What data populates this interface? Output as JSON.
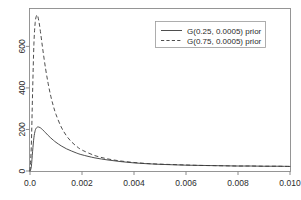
{
  "chart_data": {
    "type": "line",
    "title": "",
    "subtitle": "",
    "xlabel": "",
    "ylabel": "",
    "xlim": [
      0.0,
      0.01
    ],
    "ylim": [
      0,
      780
    ],
    "grid": false,
    "legend_position": "top-right",
    "xticks": [
      0.0,
      0.002,
      0.004,
      0.006,
      0.008,
      0.01
    ],
    "xticklabels": [
      "0.0",
      "0.002",
      "0.004",
      "0.006",
      "0.008",
      "0.010"
    ],
    "yticks": [
      0,
      200,
      400,
      600
    ],
    "yticklabels": [
      "0",
      "200",
      "400",
      "600"
    ],
    "series": [
      {
        "name": "G(0.25, 0.0005) prior",
        "style": "solid",
        "color": "#3a3a3a",
        "x": [
          0.0,
          5e-05,
          0.0001,
          0.00015,
          0.0002,
          0.00025,
          0.0003,
          0.00035,
          0.0004,
          0.00045,
          0.0005,
          0.0006,
          0.0007,
          0.0008,
          0.0009,
          0.001,
          0.0012,
          0.0014,
          0.0016,
          0.0018,
          0.002,
          0.0025,
          0.003,
          0.0035,
          0.004,
          0.0045,
          0.005,
          0.0055,
          0.006,
          0.0065,
          0.007,
          0.0075,
          0.008,
          0.0085,
          0.009,
          0.0095,
          0.01
        ],
        "y": [
          0,
          20,
          95,
          160,
          195,
          208,
          212,
          211,
          208,
          203,
          197,
          184,
          171,
          159,
          148,
          138,
          121,
          107,
          96,
          86,
          78,
          63,
          53,
          45,
          39,
          35,
          32,
          30,
          28,
          27,
          26,
          25,
          24,
          24,
          23,
          23,
          22
        ]
      },
      {
        "name": "G(0.75, 0.0005) prior",
        "style": "dashed",
        "color": "#3a3a3a",
        "x": [
          0.0,
          5e-05,
          0.0001,
          0.00015,
          0.0002,
          0.00025,
          0.00028,
          0.0003,
          0.00035,
          0.0004,
          0.00045,
          0.0005,
          0.0006,
          0.0007,
          0.0008,
          0.0009,
          0.001,
          0.0012,
          0.0014,
          0.0016,
          0.0018,
          0.002,
          0.0025,
          0.003,
          0.0035,
          0.004,
          0.0045,
          0.005,
          0.0055,
          0.006,
          0.0065,
          0.007,
          0.0075,
          0.008,
          0.0085,
          0.009,
          0.0095,
          0.01
        ],
        "y": [
          0,
          120,
          380,
          610,
          715,
          748,
          750,
          745,
          715,
          672,
          625,
          578,
          492,
          420,
          360,
          312,
          272,
          212,
          170,
          140,
          118,
          101,
          74,
          58,
          48,
          41,
          36,
          33,
          31,
          29,
          27,
          26,
          25,
          24,
          24,
          23,
          23,
          22
        ]
      }
    ],
    "legend": [
      {
        "label": "G(0.25, 0.0005) prior",
        "style": "solid"
      },
      {
        "label": "G(0.75, 0.0005) prior",
        "style": "dashed"
      }
    ],
    "colors": {
      "background": "#ffffff",
      "frame": "#8a8a8a",
      "curve": "#3a3a3a",
      "text": "#2b2b2b"
    }
  }
}
